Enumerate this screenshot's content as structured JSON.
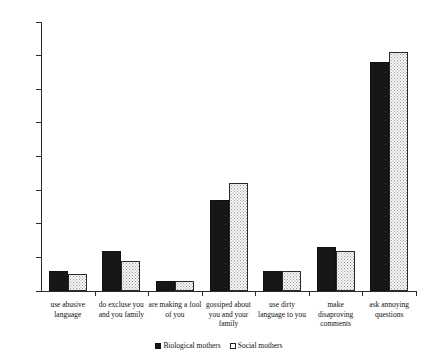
{
  "chart_data": {
    "type": "bar",
    "title": "",
    "xlabel": "",
    "ylabel": "",
    "ylim": [
      0,
      80
    ],
    "yticks": [
      0,
      10,
      20,
      30,
      40,
      50,
      60,
      70,
      80
    ],
    "grid": false,
    "legend_position": "bottom-center",
    "categories": [
      "use abusive language",
      "do excluse you and you family",
      "are making a fool of you",
      "gossiped about you and your family",
      "use dirty language to you",
      "make disaproving comments",
      "ask annoying questions"
    ],
    "category_lines": [
      [
        "use abusive",
        "language"
      ],
      [
        "do excluse you",
        "and you family"
      ],
      [
        "are making a fool",
        "of you"
      ],
      [
        "gossiped about",
        "you and your",
        "family"
      ],
      [
        "use dirty",
        "language to you"
      ],
      [
        "make",
        "disaproving",
        "comments"
      ],
      [
        "ask annoying",
        "questions"
      ]
    ],
    "series": [
      {
        "name": "Biological mothers",
        "fill": "solid-black",
        "color": "#17171a",
        "values": [
          6,
          12,
          3,
          27,
          6,
          13,
          68
        ]
      },
      {
        "name": "Social mothers",
        "fill": "dotted-white",
        "color": "#f7f7f7",
        "values": [
          5,
          9,
          3,
          32,
          6,
          12,
          71
        ]
      }
    ]
  },
  "legend": {
    "entries": [
      {
        "label": "Biological mothers"
      },
      {
        "label": "Social mothers"
      }
    ]
  }
}
